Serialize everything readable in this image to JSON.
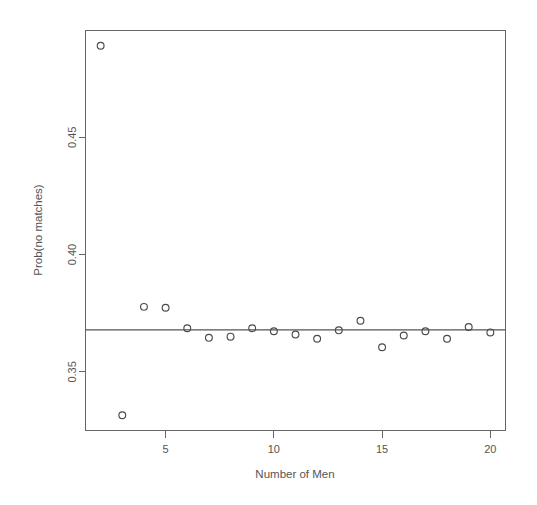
{
  "chart_data": {
    "type": "scatter",
    "title": "",
    "xlabel": "Number of Men",
    "ylabel": "Prob(no matches)",
    "xlim": [
      1.3,
      20.7
    ],
    "ylim": [
      0.325,
      0.4955
    ],
    "grid": false,
    "legend": null,
    "x_ticks": [
      5,
      10,
      15,
      20
    ],
    "x_tick_labels": [
      "5",
      "10",
      "15",
      "20"
    ],
    "y_ticks": [
      0.35,
      0.4,
      0.45
    ],
    "y_tick_labels": [
      "0.35",
      "0.40",
      "0.45"
    ],
    "marker": "open-circle",
    "marker_color": "#4a4a4a",
    "x": [
      2,
      3,
      4,
      5,
      6,
      7,
      8,
      9,
      10,
      11,
      12,
      13,
      14,
      15,
      16,
      17,
      18,
      19,
      20
    ],
    "y": [
      0.489,
      0.3315,
      0.3777,
      0.3773,
      0.3686,
      0.3645,
      0.365,
      0.3686,
      0.3673,
      0.3659,
      0.3641,
      0.3677,
      0.3718,
      0.3605,
      0.3655,
      0.3673,
      0.3641,
      0.3691,
      0.3668
    ],
    "reference_line": {
      "type": "horizontal",
      "y": 0.3679,
      "label": "",
      "color": "#555555"
    },
    "annotations": []
  },
  "figure": {
    "background_color": "#ffffff",
    "frame_color": "#666666",
    "text_color": "#555555"
  }
}
